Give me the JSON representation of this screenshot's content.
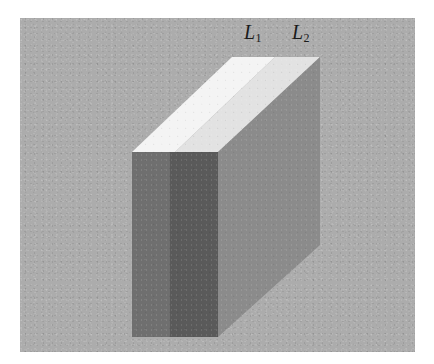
{
  "figure": {
    "canvas": {
      "width": 434,
      "height": 364,
      "background_color": "#ffffff"
    },
    "panel": {
      "name": "uniform gray surround",
      "color": "#acacac",
      "x": 20,
      "y": 18,
      "width": 395,
      "height": 334
    }
  },
  "labels": {
    "l1": {
      "base": "L",
      "subscript": "1",
      "x": 244,
      "y": 22
    },
    "l2": {
      "base": "L",
      "subscript": "2",
      "x": 292,
      "y": 22
    }
  },
  "object": {
    "name": "rectangular slab",
    "vertices": {
      "top_front_left": [
        132,
        152
      ],
      "top_back_left": [
        232,
        57
      ],
      "top_back_right": [
        320,
        57
      ],
      "top_front_right": [
        218,
        152
      ],
      "bottom_front_left": [
        132,
        337
      ],
      "bottom_front_right": [
        218,
        337
      ],
      "bottom_back_right": [
        320,
        245
      ]
    },
    "faces": [
      {
        "id": "top-left-strip",
        "label": "L1",
        "color": "#f4f4f4",
        "points": "132,152 232,57 275,57 175,152"
      },
      {
        "id": "top-right-strip",
        "label": "L2",
        "color": "#e2e2e2",
        "points": "175,152 275,57 320,57 218,152"
      },
      {
        "id": "front-left-strip",
        "label": "L1",
        "color": "#6f6f6f",
        "points": "132,152 170,152 170,337 132,337"
      },
      {
        "id": "front-right-strip",
        "label": "L2",
        "color": "#5a5a5a",
        "points": "170,152 218,152 218,337 170,337"
      },
      {
        "id": "right-side-face",
        "label": "",
        "color": "#8b8b8b",
        "points": "218,152 320,57 320,245 218,337"
      }
    ]
  },
  "colors": {
    "surround_gray": "#acacac",
    "top_bright": "#f4f4f4",
    "top_dim": "#e2e2e2",
    "front_light": "#6f6f6f",
    "front_dark": "#5a5a5a",
    "side_mid": "#8b8b8b",
    "label_ink": "#1b1b1b"
  }
}
